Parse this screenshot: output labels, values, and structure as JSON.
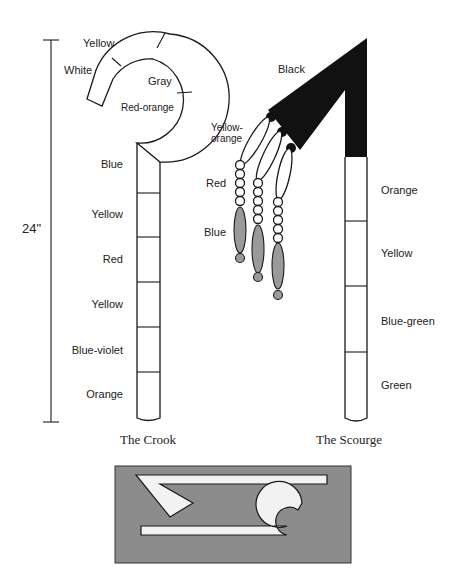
{
  "dimension": {
    "label": "24\""
  },
  "crook": {
    "caption": "The Crook",
    "hook_labels": [
      "Yellow",
      "White",
      "Gray",
      "Red-orange"
    ],
    "shaft_labels": [
      "Blue",
      "Yellow",
      "Red",
      "Yellow",
      "Blue-violet",
      "Orange"
    ]
  },
  "scourge": {
    "caption": "The Scourge",
    "handle_top_label": "Black",
    "shaft_labels": [
      "Orange",
      "Yellow",
      "Blue-green",
      "Green"
    ],
    "strand_labels": [
      "Yellow-",
      "orange",
      "Red",
      "Blue"
    ]
  },
  "colors": {
    "black": "#111111",
    "gray_bead": "#9a9a9a",
    "inset_bg": "#8c8c8c",
    "inset_shape": "#f2f2f2"
  }
}
